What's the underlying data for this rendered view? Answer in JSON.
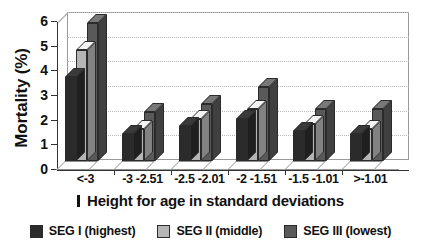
{
  "chart_data": {
    "type": "bar",
    "title": "",
    "xlabel": "Height for age in standard deviations",
    "ylabel": "Mortality (%)",
    "ylim": [
      0,
      6
    ],
    "yticks": [
      0,
      1,
      2,
      3,
      4,
      5,
      6
    ],
    "ytick_labels": [
      "0",
      "1",
      "2",
      "3",
      "4",
      "5",
      "6"
    ],
    "grid": true,
    "grid_axis": "y",
    "legend_position": "bottom",
    "style": "3d-bar",
    "categories": [
      "<-3",
      "-3 -2.51",
      "-2.5 -2.01",
      "-2 -1.51",
      "-1.5 -1.01",
      ">-1.01"
    ],
    "series": [
      {
        "name": "SEG I (highest)",
        "color": "#2b2b2b",
        "values": [
          3.4,
          1.1,
          1.4,
          1.7,
          1.2,
          1.1
        ]
      },
      {
        "name": "SEG II (middle)",
        "color": "#b5b5b5",
        "values": [
          4.5,
          1.3,
          1.7,
          2.1,
          1.5,
          1.3
        ]
      },
      {
        "name": "SEG III (lowest)",
        "color": "#595959",
        "values": [
          5.6,
          2.0,
          2.3,
          3.0,
          2.1,
          2.1
        ]
      }
    ]
  },
  "axis": {
    "x_title_glyph": "tick-mark-glyph",
    "y_title": "Mortality (%)",
    "x_title": "Height for age in standard deviations"
  },
  "legend": {
    "items": [
      {
        "label": "SEG I (highest)",
        "color": "#2b2b2b"
      },
      {
        "label": "SEG II (middle)",
        "color": "#b5b5b5"
      },
      {
        "label": "SEG III (lowest)",
        "color": "#595959"
      }
    ]
  }
}
